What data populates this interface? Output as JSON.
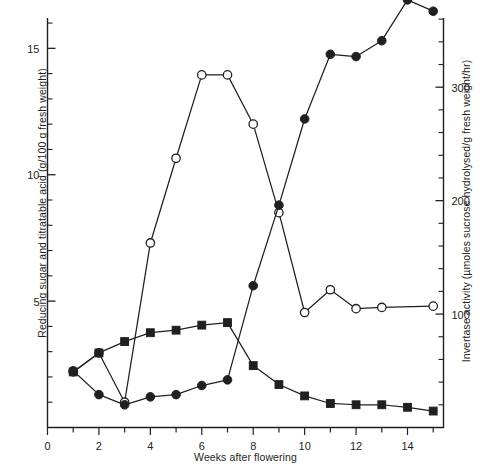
{
  "chart_data": {
    "type": "line",
    "title": "",
    "xlabel": "Weeks after flowering",
    "ylabel": "Reducing sugar and titratable acid (g/100 g fresh weight)",
    "ylabel_right": "Invertase activity (µmoles sucrose hydrolysed/g fresh weight/hr)",
    "xlim": [
      0,
      15.4
    ],
    "ylim": [
      0,
      16.2
    ],
    "ylim_right": [
      0,
      361
    ],
    "xticks": [
      0,
      1,
      2,
      3,
      4,
      5,
      6,
      7,
      8,
      9,
      10,
      11,
      12,
      13,
      14,
      15
    ],
    "xticklabels": [
      "0",
      "",
      "2",
      "",
      "4",
      "",
      "6",
      "",
      "8",
      "",
      "10",
      "",
      "12",
      "",
      "14",
      ""
    ],
    "yticks_left": [
      5,
      10,
      15
    ],
    "yticklabels_left": [
      "5",
      "10",
      "15"
    ],
    "yminorticks_left": [
      1,
      2,
      3,
      4,
      6,
      7,
      8,
      9,
      11,
      12,
      13,
      14,
      16
    ],
    "yticks_right": [
      100,
      200,
      300
    ],
    "yticklabels_right": [
      "100",
      "200",
      "300"
    ],
    "grid": false,
    "legend": "none",
    "series": [
      {
        "name": "Reducing sugar",
        "marker": "open-circle",
        "axis": "left",
        "color": "#231f20",
        "x": [
          1,
          2,
          3,
          4,
          5,
          6,
          7,
          8,
          9,
          10,
          11,
          12,
          13,
          15
        ],
        "y": [
          2.2,
          2.95,
          1.0,
          7.3,
          10.65,
          13.95,
          13.95,
          12.0,
          8.5,
          4.55,
          5.45,
          4.7,
          4.75,
          4.8
        ]
      },
      {
        "name": "Titratable acid",
        "marker": "filled-square",
        "axis": "left",
        "color": "#231f20",
        "x": [
          1,
          2,
          3,
          4,
          5,
          6,
          7,
          8,
          9,
          10,
          11,
          12,
          13,
          14,
          15
        ],
        "y": [
          2.2,
          2.95,
          3.4,
          3.75,
          3.85,
          4.05,
          4.15,
          2.45,
          1.7,
          1.25,
          0.95,
          0.9,
          0.9,
          0.8,
          0.65
        ]
      },
      {
        "name": "Invertase activity",
        "marker": "filled-circle",
        "axis": "right",
        "color": "#231f20",
        "x": [
          1,
          2,
          3,
          4,
          5,
          6,
          7,
          8,
          9,
          10,
          11,
          12,
          13,
          14,
          15
        ],
        "y": [
          50,
          29,
          20,
          27,
          29,
          37,
          42,
          125,
          196,
          272,
          329,
          327,
          341,
          377,
          367
        ]
      }
    ]
  },
  "axes": {
    "left_title": "Reducing sugar and titratable acid (g/100 g fresh weight)",
    "right_title": "Invertase activity (µmoles sucrose hydrolysed/g fresh weight/hr)",
    "bottom_title": "Weeks after flowering"
  }
}
